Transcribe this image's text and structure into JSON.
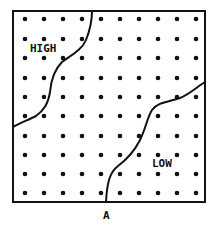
{
  "diagram": {
    "panel_label": "A",
    "region_labels": {
      "high": "HIGH",
      "low": "LOW"
    },
    "grid": {
      "columns": 10,
      "rows": 10,
      "x_positions": [
        25,
        44,
        63,
        82,
        101,
        120,
        139,
        158,
        177,
        196
      ],
      "y_positions": [
        19,
        39,
        58,
        78,
        97,
        116,
        136,
        155,
        174,
        193
      ]
    },
    "colors": {
      "stroke": "#111111",
      "background": "#ffffff",
      "dot": "#111111"
    }
  }
}
